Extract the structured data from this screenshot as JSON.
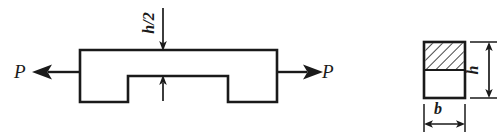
{
  "figure": {
    "colors": {
      "line": "#1a1a1a",
      "background": "#ffffff",
      "hatch": "#1a1a1a"
    },
    "labels": {
      "force_left": "P",
      "force_right": "P",
      "notch_depth": "h/2",
      "section_height": "h",
      "section_width": "b"
    },
    "icons": {
      "force_arrow_left": "arrow-left-icon",
      "force_arrow_right": "arrow-right-icon",
      "notch_arrow_top": "arrow-down-icon",
      "notch_arrow_bottom": "arrow-up-icon",
      "height_dimension": "double-arrow-vertical-icon",
      "width_dimension": "double-arrow-horizontal-icon",
      "hatch_pattern": "diagonal-hatch-icon"
    },
    "geometry": {
      "bar": {
        "left": 80,
        "right": 277,
        "top": 50,
        "bottom": 102,
        "notch_left": 128,
        "notch_right": 228,
        "notch_top": 76
      },
      "section": {
        "left": 424,
        "right": 465,
        "top": 42,
        "bottom": 98,
        "hatch_bottom": 70
      }
    }
  }
}
